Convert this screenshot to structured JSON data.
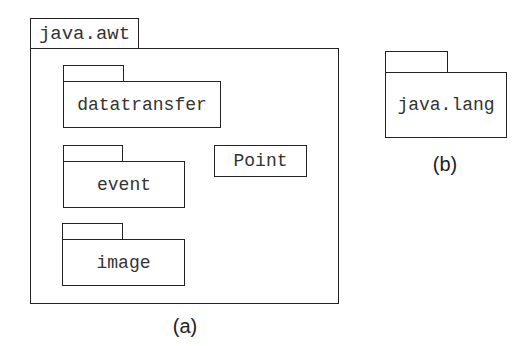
{
  "figure_a": {
    "caption": "(a)",
    "outer_package": {
      "name": "java.awt"
    },
    "subpackages": [
      {
        "name": "datatransfer"
      },
      {
        "name": "event"
      },
      {
        "name": "image"
      }
    ],
    "classes": [
      {
        "name": "Point"
      }
    ]
  },
  "figure_b": {
    "caption": "(b)",
    "package": {
      "name": "java.lang"
    }
  }
}
